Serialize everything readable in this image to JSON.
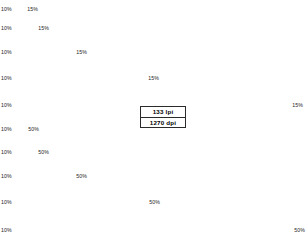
{
  "page": {
    "background": "#ffffff",
    "width": 307,
    "height": 236
  },
  "info_box": {
    "name": "screening-info-plate",
    "line1": "133 lpi",
    "line2": "1270 dpi",
    "border_color": "#2b2b2b",
    "x": 140,
    "y": 106,
    "width": 46,
    "height": 22
  },
  "chart_data": {
    "type": "bar",
    "xlabel": "",
    "ylabel": "",
    "grid": false,
    "legend": "none",
    "orientation": "horizontal",
    "note": "Each bar is a horizontal gradient ramp running from the start tint on the left to the end tint on the right. Bars grow progressively wider down each group.",
    "groups": [
      {
        "name": "light-group",
        "start_tint_label": "10%",
        "end_tint_label": "15%",
        "start_tint": 10,
        "end_tint": 15,
        "gradient_from": "#f2f2f2",
        "gradient_to": "#d9d9d9",
        "bars": [
          {
            "index": 0,
            "x": 0,
            "y": -4,
            "width": 34,
            "height": 9,
            "start_label": "10%",
            "end_label": "15%",
            "label_y": 6,
            "end_label_x": 38,
            "clipped_top": true
          },
          {
            "index": 1,
            "x": 0,
            "y": 13,
            "width": 45,
            "height": 11,
            "start_label": "10%",
            "end_label": "15%",
            "label_y": 25,
            "end_label_x": 49
          },
          {
            "index": 2,
            "x": 0,
            "y": 36,
            "width": 83,
            "height": 12,
            "start_label": "10%",
            "end_label": "15%",
            "label_y": 49,
            "end_label_x": 87
          },
          {
            "index": 3,
            "x": 0,
            "y": 60,
            "width": 155,
            "height": 14,
            "start_label": "10%",
            "end_label": "15%",
            "label_y": 75,
            "end_label_x": 159
          },
          {
            "index": 4,
            "x": 0,
            "y": 86,
            "width": 299,
            "height": 15,
            "start_label": "10%",
            "end_label": "15%",
            "label_y": 102,
            "end_label_x": 303
          }
        ]
      },
      {
        "name": "dark-group",
        "start_tint_label": "10%",
        "end_tint_label": "50%",
        "start_tint": 10,
        "end_tint": 50,
        "gradient_from": "#f0f0f0",
        "gradient_to": "#5f5f5f",
        "bars": [
          {
            "index": 0,
            "x": 0,
            "y": 113,
            "width": 25,
            "height": 11,
            "start_label": "10%",
            "end_label": "50%",
            "label_y": 126,
            "end_label_x": 39
          },
          {
            "index": 1,
            "x": 0,
            "y": 136,
            "width": 45,
            "height": 12,
            "start_label": "10%",
            "end_label": "50%",
            "label_y": 149,
            "end_label_x": 49
          },
          {
            "index": 2,
            "x": 0,
            "y": 159,
            "width": 83,
            "height": 13,
            "start_label": "10%",
            "end_label": "50%",
            "label_y": 173,
            "end_label_x": 87
          },
          {
            "index": 3,
            "x": 0,
            "y": 183,
            "width": 156,
            "height": 15,
            "start_label": "10%",
            "end_label": "50%",
            "label_y": 199,
            "end_label_x": 160
          },
          {
            "index": 4,
            "x": 0,
            "y": 208,
            "width": 301,
            "height": 17,
            "start_label": "10%",
            "end_label": "50%",
            "label_y": 227,
            "end_label_x": 305
          }
        ]
      }
    ]
  }
}
